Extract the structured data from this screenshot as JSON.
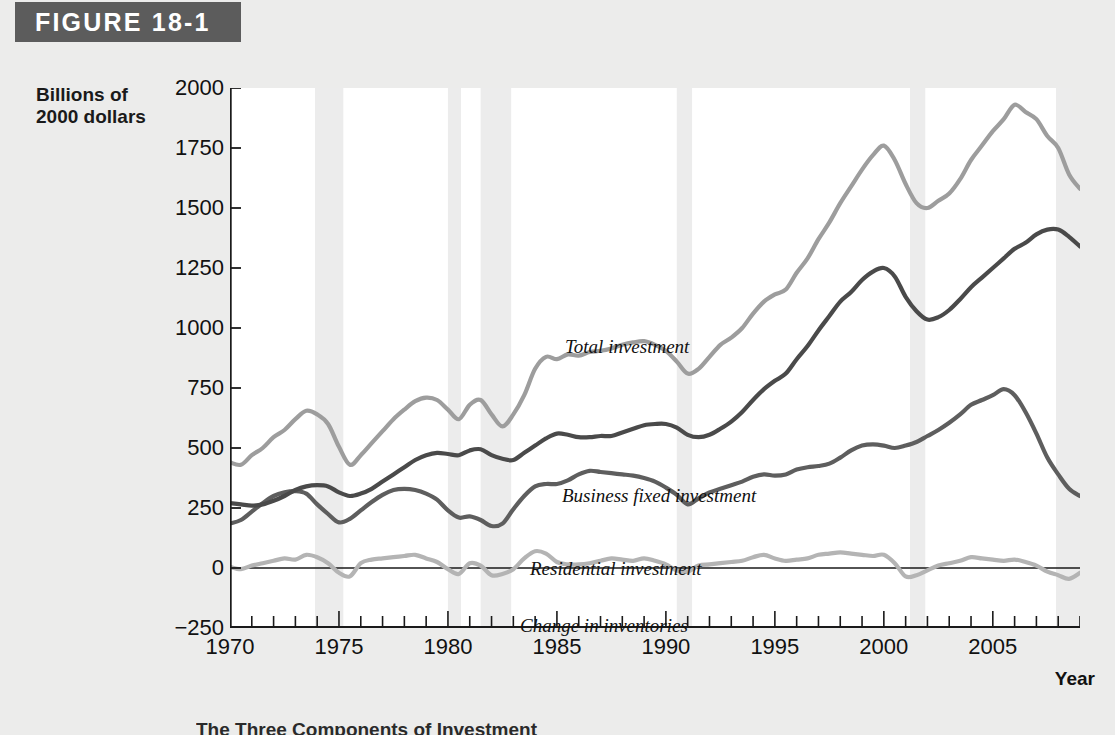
{
  "banner": {
    "label": "FIGURE 18-1"
  },
  "axes": {
    "y_title_line1": "Billions of",
    "y_title_line2": "2000 dollars",
    "x_title": "Year",
    "y_ticks": [
      "2000",
      "1750",
      "1500",
      "1250",
      "1000",
      "750",
      "500",
      "250",
      "0",
      "-250"
    ],
    "x_ticks": [
      "1970",
      "1975",
      "1980",
      "1985",
      "1990",
      "1995",
      "2000",
      "2005"
    ]
  },
  "caption": {
    "text": "The Three Components of Investment"
  },
  "series_labels": {
    "total": "Total investment",
    "business": "Business fixed investment",
    "residential": "Residential investment",
    "inventories": "Change in inventories"
  },
  "colors": {
    "banner": "#5c5c5c",
    "total": "#9d9d9d",
    "business": "#4a4a4a",
    "residential": "#5e5e5e",
    "inventories": "#b4b4b4",
    "recession_band": "#ececec",
    "axis": "#1a1a1a",
    "plot_background": "#ffffff",
    "page_background": "#ececeb"
  },
  "chart_data": {
    "type": "line",
    "title": "FIGURE 18-1",
    "xlabel": "Year",
    "ylabel": "Billions of 2000 dollars",
    "xlim": [
      1970,
      2009
    ],
    "ylim": [
      -250,
      2000
    ],
    "grid": false,
    "legend": "inline-labels",
    "x": [
      1970,
      1970.5,
      1971,
      1971.5,
      1972,
      1972.5,
      1973,
      1973.5,
      1974,
      1974.5,
      1975,
      1975.5,
      1976,
      1976.5,
      1977,
      1977.5,
      1978,
      1978.5,
      1979,
      1979.5,
      1980,
      1980.5,
      1981,
      1981.5,
      1982,
      1982.5,
      1983,
      1983.5,
      1984,
      1984.5,
      1985,
      1985.5,
      1986,
      1986.5,
      1987,
      1987.5,
      1988,
      1988.5,
      1989,
      1989.5,
      1990,
      1990.5,
      1991,
      1991.5,
      1992,
      1992.5,
      1993,
      1993.5,
      1994,
      1994.5,
      1995,
      1995.5,
      1996,
      1996.5,
      1997,
      1997.5,
      1998,
      1998.5,
      1999,
      1999.5,
      2000,
      2000.5,
      2001,
      2001.5,
      2002,
      2002.5,
      2003,
      2003.5,
      2004,
      2004.5,
      2005,
      2005.5,
      2006,
      2006.5,
      2007,
      2007.5,
      2008,
      2008.5,
      2009
    ],
    "series": [
      {
        "name": "Total investment",
        "color": "#9d9d9d",
        "values": [
          440,
          430,
          470,
          500,
          545,
          575,
          620,
          655,
          640,
          600,
          505,
          430,
          470,
          520,
          570,
          620,
          660,
          695,
          710,
          700,
          660,
          620,
          680,
          700,
          640,
          590,
          640,
          720,
          830,
          880,
          870,
          890,
          885,
          900,
          905,
          915,
          930,
          940,
          945,
          930,
          905,
          860,
          810,
          830,
          880,
          930,
          960,
          1000,
          1060,
          1110,
          1140,
          1160,
          1230,
          1290,
          1370,
          1440,
          1520,
          1590,
          1660,
          1720,
          1760,
          1700,
          1600,
          1520,
          1500,
          1530,
          1560,
          1620,
          1700,
          1760,
          1820,
          1870,
          1930,
          1900,
          1870,
          1800,
          1750,
          1640,
          1580
        ]
      },
      {
        "name": "Business fixed investment",
        "color": "#4a4a4a",
        "values": [
          270,
          265,
          260,
          265,
          280,
          300,
          325,
          340,
          345,
          340,
          315,
          300,
          310,
          330,
          360,
          390,
          420,
          450,
          470,
          480,
          475,
          470,
          490,
          495,
          470,
          455,
          450,
          480,
          510,
          540,
          560,
          555,
          545,
          545,
          550,
          550,
          565,
          580,
          595,
          600,
          600,
          585,
          555,
          545,
          555,
          580,
          610,
          650,
          700,
          745,
          780,
          810,
          870,
          925,
          990,
          1050,
          1110,
          1150,
          1200,
          1235,
          1250,
          1215,
          1130,
          1070,
          1035,
          1045,
          1075,
          1120,
          1170,
          1210,
          1250,
          1290,
          1330,
          1355,
          1390,
          1410,
          1410,
          1380,
          1340
        ]
      },
      {
        "name": "Residential investment",
        "color": "#5e5e5e",
        "values": [
          185,
          200,
          235,
          270,
          300,
          315,
          320,
          310,
          265,
          225,
          190,
          205,
          240,
          275,
          305,
          325,
          330,
          325,
          310,
          285,
          240,
          210,
          215,
          200,
          175,
          185,
          245,
          300,
          340,
          350,
          350,
          365,
          390,
          405,
          400,
          395,
          390,
          385,
          375,
          360,
          335,
          305,
          265,
          290,
          315,
          330,
          345,
          360,
          380,
          390,
          385,
          390,
          410,
          420,
          425,
          435,
          460,
          490,
          510,
          515,
          510,
          500,
          510,
          525,
          550,
          575,
          605,
          640,
          680,
          700,
          720,
          745,
          720,
          650,
          560,
          460,
          390,
          330,
          300
        ]
      },
      {
        "name": "Change in inventories",
        "color": "#b4b4b4",
        "values": [
          5,
          -5,
          10,
          20,
          30,
          40,
          35,
          55,
          45,
          20,
          -20,
          -35,
          20,
          35,
          40,
          45,
          50,
          55,
          40,
          25,
          -5,
          -25,
          20,
          10,
          -30,
          -25,
          -5,
          40,
          70,
          60,
          25,
          15,
          15,
          20,
          30,
          40,
          35,
          30,
          40,
          30,
          15,
          -10,
          -15,
          10,
          15,
          20,
          25,
          30,
          45,
          55,
          40,
          30,
          35,
          40,
          55,
          60,
          65,
          60,
          55,
          50,
          55,
          20,
          -35,
          -30,
          -10,
          10,
          20,
          30,
          45,
          40,
          35,
          30,
          35,
          25,
          10,
          -15,
          -30,
          -45,
          -20
        ]
      }
    ],
    "recession_bands": [
      {
        "start": 1973.9,
        "end": 1975.2
      },
      {
        "start": 1980.0,
        "end": 1980.6
      },
      {
        "start": 1981.5,
        "end": 1982.9
      },
      {
        "start": 1990.5,
        "end": 1991.2
      },
      {
        "start": 2001.2,
        "end": 2001.9
      },
      {
        "start": 2007.9,
        "end": 2009.0
      }
    ]
  }
}
